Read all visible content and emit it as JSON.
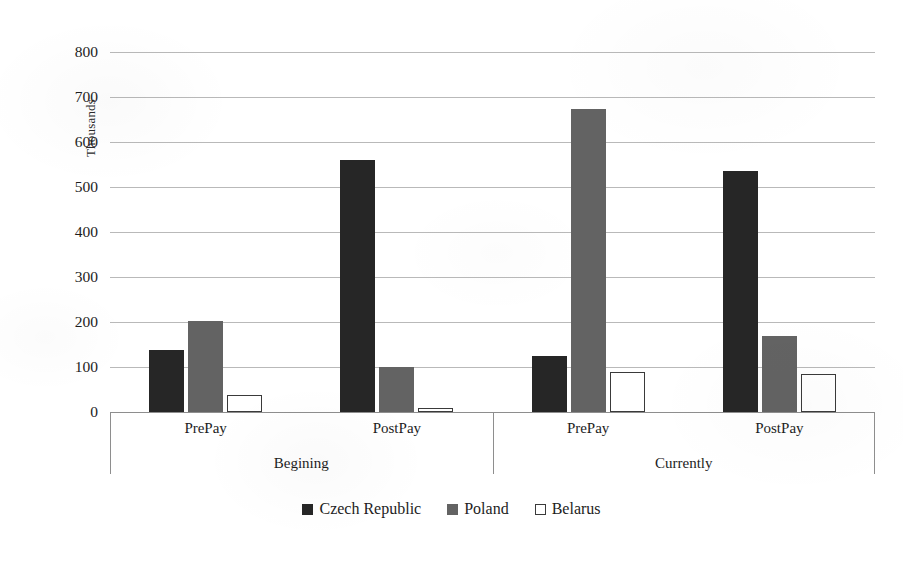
{
  "chart_data": {
    "type": "bar",
    "title": "",
    "xlabel": "",
    "ylabel": "Thousands",
    "ylim": [
      0,
      800
    ],
    "ytick_step": 100,
    "yticks": [
      800,
      700,
      600,
      500,
      400,
      300,
      200,
      100,
      0
    ],
    "grid": true,
    "legend_position": "bottom",
    "categories": [
      "PrePay",
      "PostPay",
      "PrePay",
      "PostPay"
    ],
    "groups": [
      {
        "label": "Begining",
        "categories": [
          "PrePay",
          "PostPay"
        ]
      },
      {
        "label": "Currently",
        "categories": [
          "PrePay",
          "PostPay"
        ]
      }
    ],
    "series": [
      {
        "name": "Czech Republic",
        "color": "#262626",
        "values": [
          137,
          560,
          125,
          535
        ]
      },
      {
        "name": "Poland",
        "color": "#636363",
        "values": [
          203,
          100,
          673,
          170
        ]
      },
      {
        "name": "Belarus",
        "color": "#ffffff",
        "values": [
          38,
          8,
          90,
          85
        ]
      }
    ]
  },
  "axis": {
    "y_title": "Thousands",
    "tick_labels": [
      "800",
      "700",
      "600",
      "500",
      "400",
      "300",
      "200",
      "100",
      "0"
    ]
  },
  "categories": {
    "sub_labels": [
      "PrePay",
      "PostPay",
      "PrePay",
      "PostPay"
    ],
    "group_labels": [
      "Begining",
      "Currently"
    ]
  },
  "legend": {
    "items": [
      {
        "label": "Czech Republic",
        "swatch": "filled-black-square-icon"
      },
      {
        "label": "Poland",
        "swatch": "filled-gray-square-icon"
      },
      {
        "label": "Belarus",
        "swatch": "outlined-white-square-icon"
      }
    ]
  }
}
